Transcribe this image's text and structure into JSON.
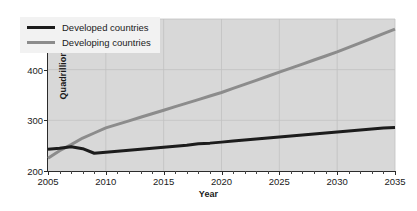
{
  "chart_data": {
    "type": "line",
    "title": "",
    "subtitle": "",
    "xlabel": "Year",
    "ylabel": "Quadrillion BTUs",
    "xlim": [
      2005,
      2035
    ],
    "ylim": [
      200,
      500
    ],
    "y_ticks": [
      200,
      300,
      400,
      500
    ],
    "x_ticks": [
      2005,
      2010,
      2015,
      2020,
      2025,
      2030,
      2035
    ],
    "x_minor_tick_step": 1,
    "grid": true,
    "grid_color": "#c2c2c2",
    "plot_background": "#d8d8d8",
    "legend_position": "upper left",
    "legend_background": "#f2f2f2",
    "series": [
      {
        "name": "Developed countries",
        "color": "#1c1c1c",
        "width": 3.0,
        "x": [
          2005,
          2006,
          2007,
          2008,
          2009,
          2010,
          2011,
          2012,
          2013,
          2014,
          2015,
          2016,
          2017,
          2018,
          2019,
          2020,
          2021,
          2022,
          2023,
          2024,
          2025,
          2026,
          2027,
          2028,
          2029,
          2030,
          2031,
          2032,
          2033,
          2034,
          2035
        ],
        "values": [
          243,
          245,
          248,
          244,
          235,
          237,
          239,
          241,
          243,
          245,
          247,
          249,
          251,
          254,
          255,
          257,
          259,
          261,
          263,
          265,
          267,
          269,
          271,
          273,
          275,
          277,
          279,
          281,
          283,
          285,
          286
        ]
      },
      {
        "name": "Developing countries",
        "color": "#8c8c8c",
        "width": 3.0,
        "x": [
          2005,
          2006,
          2007,
          2008,
          2009,
          2010,
          2011,
          2012,
          2013,
          2014,
          2015,
          2016,
          2017,
          2018,
          2019,
          2020,
          2021,
          2022,
          2023,
          2024,
          2025,
          2026,
          2027,
          2028,
          2029,
          2030,
          2031,
          2032,
          2033,
          2034,
          2035
        ],
        "values": [
          225,
          240,
          252,
          265,
          275,
          285,
          292,
          299,
          306,
          313,
          320,
          327,
          334,
          341,
          348,
          355,
          363,
          371,
          379,
          387,
          395,
          403,
          411,
          419,
          427,
          435,
          444,
          453,
          462,
          471,
          480
        ]
      }
    ]
  },
  "axes": {
    "y_label": "Quadrillion BTUs",
    "x_label": "Year",
    "y_tick_labels": [
      "200",
      "300",
      "400",
      "500"
    ],
    "x_tick_labels": [
      "2005",
      "2010",
      "2015",
      "2020",
      "2025",
      "2030",
      "2035"
    ]
  },
  "legend": {
    "entries": [
      {
        "label": "Developed countries",
        "color": "#1c1c1c"
      },
      {
        "label": "Developing countries",
        "color": "#8c8c8c"
      }
    ]
  }
}
